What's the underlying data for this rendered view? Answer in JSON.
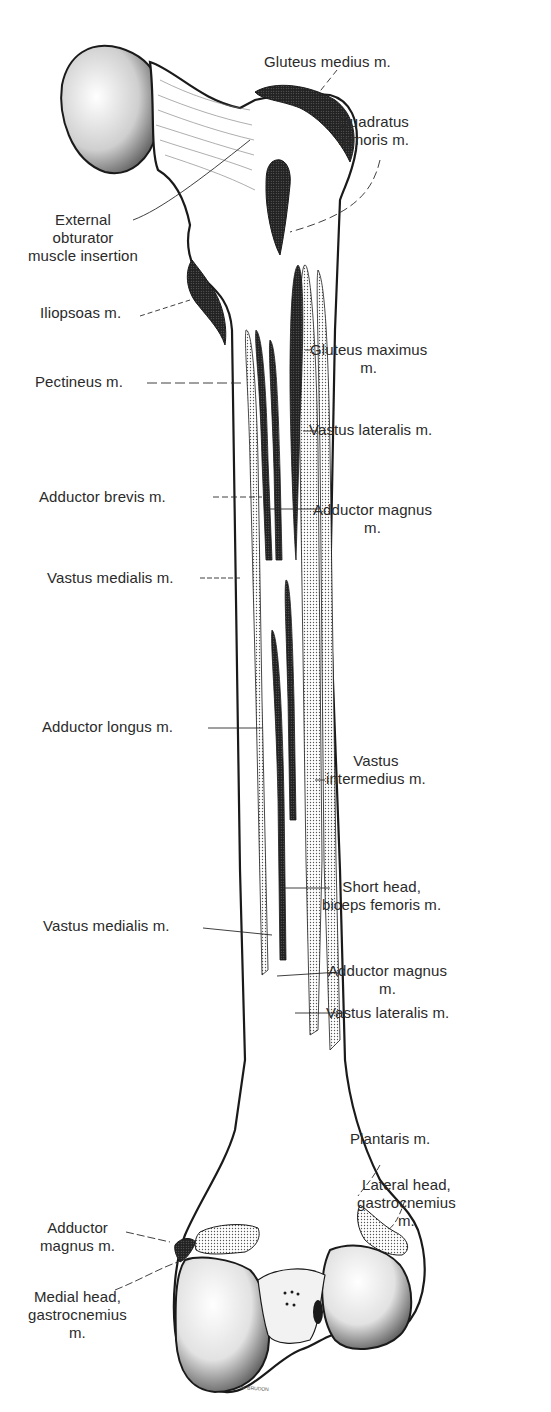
{
  "figure": {
    "signature": "W. BRUDON"
  },
  "labels": {
    "gluteus_medius": "Gluteus medius m.",
    "quadratus_femoris": "Quadratus\nfemoris m.",
    "external_obturator": "External\nobturator\nmuscle insertion",
    "iliopsoas": "Iliopsoas m.",
    "gluteus_maximus": "Gluteus maximus\nm.",
    "pectineus": "Pectineus m.",
    "vastus_lateralis_upper": "Vastus lateralis m.",
    "adductor_brevis": "Adductor brevis m.",
    "adductor_magnus_upper": "Adductor magnus\nm.",
    "vastus_medialis_upper": "Vastus medialis m.",
    "adductor_longus": "Adductor longus m.",
    "vastus_intermedius": "Vastus\nintermedius m.",
    "short_head_biceps": "Short head,\nbiceps femoris m.",
    "vastus_medialis_lower": "Vastus medialis m.",
    "adductor_magnus_middle": "Adductor magnus\nm.",
    "vastus_lateralis_lower": "Vastus lateralis m.",
    "plantaris": "Plantaris m.",
    "lateral_head_gastrocnemius": "Lateral head,\ngastrocnemius\nm.",
    "adductor_magnus_lower": "Adductor\nmagnus m.",
    "medial_head_gastrocnemius": "Medial head,\ngastrocnemius\nm."
  },
  "colors": {
    "ink": "#1a1a1a",
    "dark_insertion": "#2b2b2b",
    "stipple_insertion": "#d4d4d4",
    "bone": "#ffffff"
  }
}
